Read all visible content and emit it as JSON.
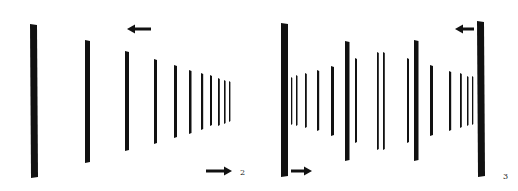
{
  "figures": [
    {
      "id": "figure-2",
      "label": "2",
      "description": "Row of vertical bars receding in perspective to the right, with motion arrows",
      "arrows": [
        {
          "direction": "left",
          "position": "top"
        },
        {
          "direction": "right",
          "position": "bottom-right"
        }
      ],
      "bar_count": 11
    },
    {
      "id": "figure-3",
      "label": "3",
      "description": "Two rows of vertical bars receding toward a central vanishing area, with motion arrows",
      "arrows": [
        {
          "direction": "left",
          "position": "top-right"
        },
        {
          "direction": "right",
          "position": "bottom-left"
        }
      ],
      "bar_count": 21
    }
  ],
  "colors": {
    "ink": "#111111",
    "background": "#ffffff"
  }
}
